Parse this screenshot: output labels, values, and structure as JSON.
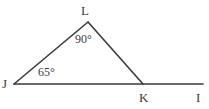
{
  "figure": {
    "type": "geometry-diagram",
    "background_color": "#ffffff",
    "stroke_color": "#3a3a3a",
    "text_color": "#3a3a3a",
    "vertices": {
      "J": {
        "label": "J",
        "x": 14,
        "y": 84
      },
      "L": {
        "label": "L",
        "x": 88,
        "y": 22
      },
      "K": {
        "label": "K",
        "x": 143,
        "y": 84
      },
      "I": {
        "label": "I",
        "x": 203,
        "y": 84
      }
    },
    "segments": [
      {
        "name": "JL",
        "from": "J",
        "to": "L"
      },
      {
        "name": "LK",
        "from": "L",
        "to": "K"
      },
      {
        "name": "JI",
        "from": "J",
        "to": "I"
      }
    ],
    "angles": [
      {
        "at": "L",
        "value": "90°",
        "measure": 90
      },
      {
        "at": "J",
        "value": "65°",
        "measure": 65
      }
    ]
  },
  "labels": {
    "vertex_L": "L",
    "vertex_J": "J",
    "vertex_K": "K",
    "vertex_I": "I",
    "angle_at_L": "90°",
    "angle_at_J": "65°"
  }
}
